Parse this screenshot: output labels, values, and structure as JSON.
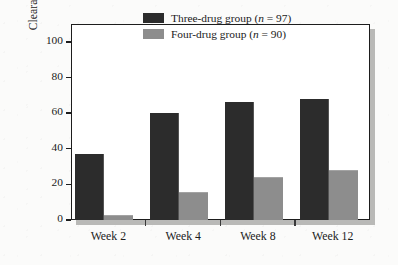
{
  "chart_data": {
    "type": "bar",
    "title": "",
    "subtitle": "",
    "xlabel": "",
    "ylabel": "Clearance of bacteremia, %",
    "categories": [
      "Week 2",
      "Week 4",
      "Week 8",
      "Week 12"
    ],
    "ylim": [
      0,
      110
    ],
    "yticks": [
      0,
      20,
      40,
      60,
      80,
      100
    ],
    "ytick_labels": [
      "0",
      "20",
      "40",
      "60",
      "80",
      "100"
    ],
    "grid": false,
    "legend_position": "top-right",
    "series": [
      {
        "name": "Three-drug group (n = 97)",
        "label_main": "Three-drug group (",
        "label_italic": "n",
        "label_tail": " = 97)",
        "color": "#2c2c2c",
        "values": [
          37,
          60,
          66,
          68
        ]
      },
      {
        "name": "Four-drug group (n = 90)",
        "label_main": "Four-drug group (",
        "label_italic": "n",
        "label_tail": " = 90)",
        "color": "#8d8d8d",
        "values": [
          3,
          16,
          24,
          28
        ]
      }
    ],
    "annotations": []
  },
  "axis": {
    "y_label": "Clearance of bacteremia, %"
  },
  "colors": {
    "primary_bar": "#2c2c2c",
    "secondary_bar": "#8d8d8d",
    "frame": "#1d1d1d",
    "text": "#1c1c1c",
    "page_background": "#fbfbfa",
    "shadow": "#b9b9b7"
  }
}
